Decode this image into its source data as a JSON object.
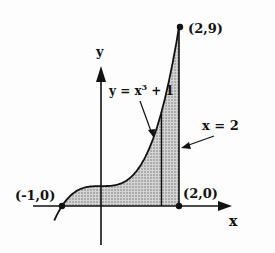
{
  "diagram": {
    "type": "region-under-curve",
    "curve": {
      "equation": "y = x³ + 1",
      "label_main": "y = x",
      "label_exp": "3",
      "label_tail": " + 1",
      "domain": [
        -1.2,
        2
      ]
    },
    "boundary": {
      "label": "x = 2"
    },
    "axes": {
      "x_label": "x",
      "y_label": "y"
    },
    "points": [
      {
        "label": "(-1,0)",
        "x": -1,
        "y": 0
      },
      {
        "label": "(2,0)",
        "x": 2,
        "y": 0
      },
      {
        "label": "(2,9)",
        "x": 2,
        "y": 9
      }
    ],
    "shaded_region": {
      "from_x": -1,
      "to_x": 2,
      "fill": "#b8b8b8"
    },
    "representative_strip_x": 1.55,
    "colors": {
      "ink": "#111111",
      "shade": "#b8b8b8"
    }
  }
}
